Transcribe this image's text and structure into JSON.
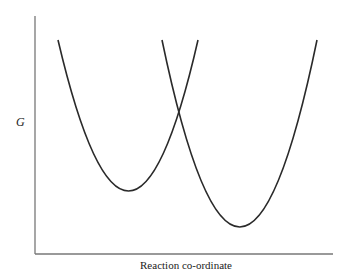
{
  "diagram": {
    "type": "free-energy-parabolas",
    "y_axis_label": "G",
    "x_axis_label": "Reaction co-ordinate",
    "curves": [
      {
        "name": "reactant-parabola",
        "vertex": [
          129,
          191
        ],
        "top_y": 40,
        "left_x": 58,
        "right_x": 198
      },
      {
        "name": "product-parabola",
        "vertex": [
          240,
          227
        ],
        "top_y": 40,
        "left_x": 162,
        "right_x": 317
      }
    ],
    "colors": {
      "curve": "#2a2a2a",
      "axis": "#777777"
    }
  }
}
